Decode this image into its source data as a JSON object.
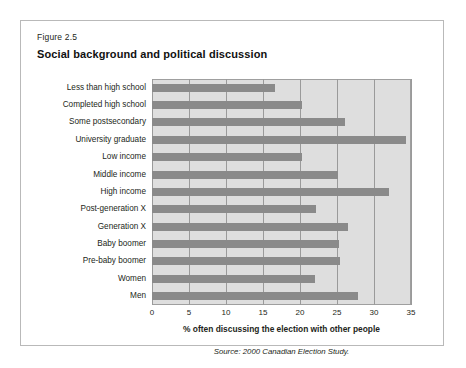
{
  "figure": {
    "number": "Figure 2.5",
    "title": "Social background and political discussion",
    "source": "Source: 2000 Canadian Election Study."
  },
  "chart_data": {
    "type": "bar",
    "orientation": "horizontal",
    "title": "Social background and political discussion",
    "subtitle": "Figure 2.5",
    "xlabel": "% often discussing the election with other people",
    "ylabel": "",
    "xlim": [
      0,
      35
    ],
    "xticks": [
      0,
      5,
      10,
      15,
      20,
      25,
      30,
      35
    ],
    "grid": true,
    "legend": null,
    "categories": [
      "Less than high school",
      "Completed high school",
      "Some postsecondary",
      "University graduate",
      "Low income",
      "Middle income",
      "High income",
      "Post-generation X",
      "Generation X",
      "Baby boomer",
      "Pre-baby boomer",
      "Women",
      "Men"
    ],
    "values": [
      16.6,
      20.3,
      26.1,
      34.3,
      20.3,
      25.2,
      32.0,
      22.1,
      26.5,
      25.3,
      25.4,
      22.0,
      27.9
    ],
    "bar_color": "#8a8a8a",
    "plot_background": "#dedede",
    "source": "Source: 2000 Canadian Election Study."
  }
}
